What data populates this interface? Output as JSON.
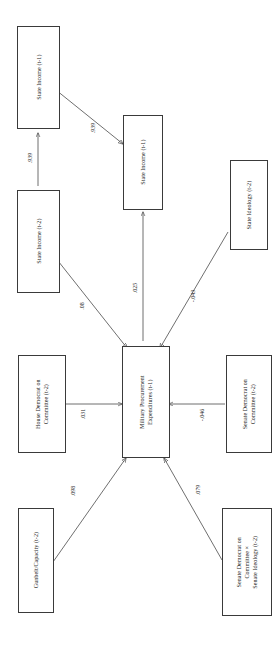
{
  "figure": {
    "kind": "path-diagram",
    "orientation": "rotated-90-ccw",
    "nodes": [
      {
        "id": "state_income_t1_top",
        "label": "State Income (t-1)",
        "lines": [
          "State Income (t-1)"
        ]
      },
      {
        "id": "state_income_t2",
        "label": "State Income (t-2)",
        "lines": [
          "State Income (t-2)"
        ]
      },
      {
        "id": "state_income_t1_mid",
        "label": "State Income (t-1)",
        "lines": [
          "State Income (t-1)"
        ]
      },
      {
        "id": "state_ideology_t2",
        "label": "State Ideology (t-2)",
        "lines": [
          "State Ideology (t-2)"
        ]
      },
      {
        "id": "house_dem_committee_t2",
        "label": "House Democrat on Committee (t-2)",
        "lines": [
          "House Democrat on",
          "Committee (t-2)"
        ]
      },
      {
        "id": "military_procurement_t1",
        "label": "Military Procurement Expenditures (t-1)",
        "lines": [
          "Military Procurement",
          "Expenditures (t-1)"
        ]
      },
      {
        "id": "senate_dem_committee_t2",
        "label": "Senate Democrat on Committee (t-2)",
        "lines": [
          "Senate Democrat on",
          "Committee (t-2)"
        ]
      },
      {
        "id": "gunbelt_capacity_t2",
        "label": "Gunbelt/Capacity (t-2)",
        "lines": [
          "Gunbelt/Capacity (t-2)"
        ]
      },
      {
        "id": "senate_dem_x_ideology_t2",
        "label": "Senate Democrat on Committee × Senate Ideology (t-2)",
        "lines": [
          "Senate Democrat on",
          "Committee ×",
          "Senate Ideology (t-2)"
        ]
      }
    ],
    "edges": [
      {
        "id": "e1",
        "from": "state_income_t2",
        "to": "state_income_t1_top",
        "coefficient": ".939"
      },
      {
        "id": "e2",
        "from": "state_income_t1_top",
        "to": "state_income_t1_mid",
        "coefficient": ".939"
      },
      {
        "id": "e3",
        "from": "state_income_t2",
        "to": "military_procurement_t1",
        "coefficient": ".08"
      },
      {
        "id": "e4",
        "from": "military_procurement_t1",
        "to": "state_income_t1_mid",
        "coefficient": ".025"
      },
      {
        "id": "e5",
        "from": "state_ideology_t2",
        "to": "military_procurement_t1",
        "coefficient": "-.043"
      },
      {
        "id": "e6",
        "from": "house_dem_committee_t2",
        "to": "military_procurement_t1",
        "coefficient": ".031"
      },
      {
        "id": "e7",
        "from": "senate_dem_committee_t2",
        "to": "military_procurement_t1",
        "coefficient": "-.046"
      },
      {
        "id": "e8",
        "from": "gunbelt_capacity_t2",
        "to": "military_procurement_t1",
        "coefficient": ".098"
      },
      {
        "id": "e9",
        "from": "senate_dem_x_ideology_t2",
        "to": "military_procurement_t1",
        "coefficient": ".079"
      }
    ],
    "colors": {
      "box_border": "#3a3a3a",
      "arrow": "#4a4a4a",
      "text": "#1c1c1c",
      "background": "#ffffff"
    }
  }
}
